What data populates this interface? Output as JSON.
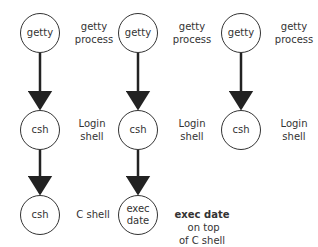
{
  "columns": [
    {
      "nodes": [
        {
          "text": "getty",
          "label": "getty\nprocess"
        },
        {
          "text": "csh",
          "label": "Login\nshell"
        },
        {
          "text": "csh",
          "label": "C shell"
        }
      ]
    },
    {
      "nodes": [
        {
          "text": "getty",
          "label": "getty\nprocess"
        },
        {
          "text": "csh",
          "label": "Login\nshell"
        },
        {
          "text": "exec\ndate",
          "label_bold": "exec date",
          "label_rest": " on top\nof C shell"
        }
      ]
    },
    {
      "nodes": [
        {
          "text": "getty",
          "label": "getty\nprocess"
        },
        {
          "text": "csh",
          "label": "Login\nshell"
        }
      ]
    }
  ],
  "n": {
    "c1n1": "getty",
    "c1n2": "csh",
    "c1n3": "csh",
    "c2n1": "getty",
    "c2n2": "csh",
    "c2n3a": "exec",
    "c2n3b": "date",
    "c3n1": "getty",
    "c3n2": "csh"
  },
  "l": {
    "getty": "getty",
    "process": "process",
    "login": "Login",
    "shell": "shell",
    "cshell": "C shell",
    "execdate": "exec date",
    "ontop": " on top",
    "ofc": "of C shell"
  }
}
